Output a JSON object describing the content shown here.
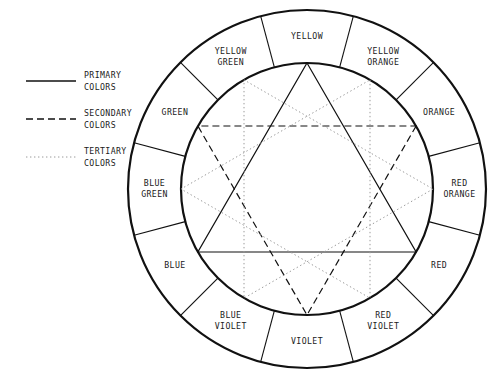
{
  "diagram": {
    "background_color": "#ffffff",
    "line_color": "#111111",
    "tertiary_line_color": "#9a9a9a"
  },
  "legend": {
    "items": [
      {
        "id": "primary",
        "line_1": "PRIMARY",
        "line_2": "COLORS",
        "style": "solid",
        "swatch_name": "solid-line-swatch"
      },
      {
        "id": "secondary",
        "line_1": "SECONDARY",
        "line_2": "COLORS",
        "style": "dashed",
        "swatch_name": "dashed-line-swatch"
      },
      {
        "id": "tertiary",
        "line_1": "TERTIARY",
        "line_2": "COLORS",
        "style": "dotted",
        "swatch_name": "dotted-line-swatch"
      }
    ]
  },
  "wheel": {
    "center_x": 307,
    "center_y": 189,
    "outer_radius": 179,
    "ring_inner_radius": 126,
    "segment_count": 12,
    "segments": [
      {
        "index": 0,
        "angle_deg": 0,
        "category": "primary",
        "line_1": "YELLOW",
        "line_2": ""
      },
      {
        "index": 1,
        "angle_deg": 30,
        "category": "tertiary",
        "line_1": "YELLOW",
        "line_2": "ORANGE"
      },
      {
        "index": 2,
        "angle_deg": 60,
        "category": "secondary",
        "line_1": "ORANGE",
        "line_2": ""
      },
      {
        "index": 3,
        "angle_deg": 90,
        "category": "tertiary",
        "line_1": "RED",
        "line_2": "ORANGE"
      },
      {
        "index": 4,
        "angle_deg": 120,
        "category": "primary",
        "line_1": "RED",
        "line_2": ""
      },
      {
        "index": 5,
        "angle_deg": 150,
        "category": "tertiary",
        "line_1": "RED",
        "line_2": "VIOLET"
      },
      {
        "index": 6,
        "angle_deg": 180,
        "category": "secondary",
        "line_1": "VIOLET",
        "line_2": ""
      },
      {
        "index": 7,
        "angle_deg": 210,
        "category": "tertiary",
        "line_1": "BLUE",
        "line_2": "VIOLET"
      },
      {
        "index": 8,
        "angle_deg": 240,
        "category": "primary",
        "line_1": "BLUE",
        "line_2": ""
      },
      {
        "index": 9,
        "angle_deg": 270,
        "category": "tertiary",
        "line_1": "BLUE",
        "line_2": "GREEN"
      },
      {
        "index": 10,
        "angle_deg": 300,
        "category": "secondary",
        "line_1": "GREEN",
        "line_2": ""
      },
      {
        "index": 11,
        "angle_deg": 330,
        "category": "tertiary",
        "line_1": "YELLOW",
        "line_2": "GREEN"
      }
    ],
    "triangles": [
      {
        "id": "primary-triangle",
        "style": "solid",
        "vertices": [
          0,
          4,
          8
        ]
      },
      {
        "id": "secondary-triangle",
        "style": "dashed",
        "vertices": [
          2,
          6,
          10
        ]
      },
      {
        "id": "tertiary-triangle-a",
        "style": "dotted",
        "vertices": [
          1,
          5,
          9
        ]
      },
      {
        "id": "tertiary-triangle-b",
        "style": "dotted",
        "vertices": [
          3,
          7,
          11
        ]
      }
    ]
  }
}
